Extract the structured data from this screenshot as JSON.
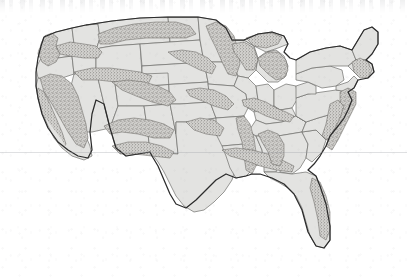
{
  "figure": {
    "map_kind": "choropleth-stipple",
    "region": "Contiguous United States (Lower 48)",
    "projection_look": "Albers-like conic",
    "has_labels": false,
    "has_legend": false,
    "has_title_text": false,
    "has_scale_bar": false,
    "has_north_arrow": false
  },
  "chart_data": {
    "type": "map",
    "title": "",
    "subtitle": "",
    "legend": [],
    "categories": [
      "state-fill",
      "stippled-region"
    ]
  },
  "colors": {
    "background": "#ffffff",
    "paper_tone": "#f7f7f6",
    "state_fill": "#e3e3e1",
    "state_border": "#6e6e6c",
    "nation_outline": "#2b2b2b",
    "stipple_dot": "#555250",
    "stipple_fill": "#cfcecb",
    "scan_noise": "#96969b"
  },
  "layers": {
    "state_boundaries_label": "State boundaries",
    "national_outline_label": "National outline",
    "stipple_label": "Stippled relief / valley regions"
  },
  "stipple_regions": [
    {
      "name": "cascade-range",
      "area": "Pacific Northwest"
    },
    {
      "name": "sierra-nevada",
      "area": "Eastern California"
    },
    {
      "name": "coast-ranges",
      "area": "California coast"
    },
    {
      "name": "northern-rockies",
      "area": "Montana / Idaho"
    },
    {
      "name": "central-rockies",
      "area": "Colorado / Utah"
    },
    {
      "name": "southern-rockies",
      "area": "New Mexico / Arizona"
    },
    {
      "name": "missouri-river-valley",
      "area": "Dakotas / Nebraska"
    },
    {
      "name": "upper-mississippi-valley",
      "area": "Minnesota / Wisconsin"
    },
    {
      "name": "great-lakes-shore",
      "area": "Michigan"
    },
    {
      "name": "ohio-river-valley",
      "area": "Ohio / Indiana / Kentucky"
    },
    {
      "name": "lower-mississippi-valley",
      "area": "Arkansas / Mississippi / Louisiana"
    },
    {
      "name": "appalachian-range",
      "area": "Virginia / Carolinas"
    },
    {
      "name": "gulf-coastal-plain",
      "area": "Alabama / Florida panhandle"
    },
    {
      "name": "new-england-coast",
      "area": "Northeast seaboard"
    }
  ],
  "scan_artifacts": {
    "ghost_text_top": "faint bleed-through text band",
    "horizontal_rule_y": 152
  }
}
